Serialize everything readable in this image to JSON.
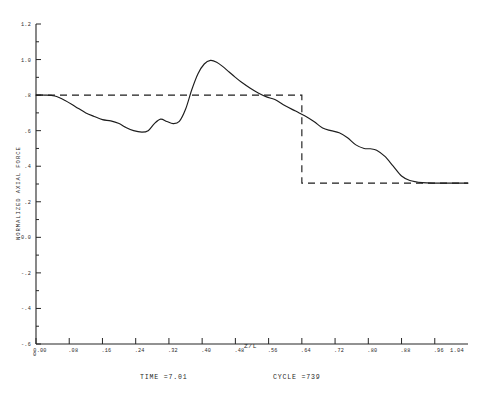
{
  "chart_data": {
    "type": "line",
    "title": "",
    "xlabel": "Z/L",
    "ylabel": "NORMALIZED AXIAL FORCE",
    "xlim": [
      0.0,
      1.04
    ],
    "ylim": [
      -0.6,
      1.2
    ],
    "grid": false,
    "legend": false,
    "x_tick_labels": [
      "0.00",
      ".08",
      ".16",
      ".24",
      ".32",
      ".40",
      ".48",
      ".56",
      ".64",
      ".72",
      ".80",
      ".88",
      ".96"
    ],
    "x_tick_values": [
      0.0,
      0.08,
      0.16,
      0.24,
      0.32,
      0.4,
      0.48,
      0.56,
      0.64,
      0.72,
      0.8,
      0.88,
      0.96
    ],
    "x_axis_end_label": "1.04",
    "x_origin_label": "0",
    "y_tick_labels": [
      "1.2",
      "1.0",
      ".8",
      ".6",
      ".4",
      ".2",
      "0.0",
      "-.2",
      "-.4",
      "-.6"
    ],
    "y_tick_values": [
      1.2,
      1.0,
      0.8,
      0.6,
      0.4,
      0.2,
      0.0,
      -0.2,
      -0.4,
      -0.6
    ],
    "y_labeled_ticks": [
      "1.2",
      "1.0",
      ".8",
      ".6",
      ".4",
      ".2",
      "0.0",
      "-.2",
      "-.4",
      "-.6"
    ],
    "series": [
      {
        "name": "computed axial force",
        "style": "solid",
        "x": [
          0.0,
          0.02,
          0.045,
          0.07,
          0.095,
          0.12,
          0.14,
          0.16,
          0.18,
          0.2,
          0.215,
          0.235,
          0.255,
          0.27,
          0.285,
          0.3,
          0.315,
          0.33,
          0.345,
          0.36,
          0.375,
          0.39,
          0.405,
          0.42,
          0.435,
          0.45,
          0.465,
          0.48,
          0.495,
          0.515,
          0.535,
          0.555,
          0.575,
          0.6,
          0.625,
          0.65,
          0.67,
          0.69,
          0.71,
          0.73,
          0.75,
          0.77,
          0.79,
          0.805,
          0.82,
          0.84,
          0.86,
          0.88,
          0.9,
          0.93,
          0.96,
          1.0,
          1.04
        ],
        "y": [
          0.8,
          0.8,
          0.795,
          0.77,
          0.735,
          0.7,
          0.68,
          0.662,
          0.655,
          0.64,
          0.62,
          0.6,
          0.592,
          0.6,
          0.64,
          0.665,
          0.652,
          0.64,
          0.652,
          0.72,
          0.83,
          0.92,
          0.975,
          0.995,
          0.985,
          0.96,
          0.93,
          0.9,
          0.872,
          0.84,
          0.812,
          0.79,
          0.775,
          0.74,
          0.71,
          0.68,
          0.65,
          0.615,
          0.6,
          0.588,
          0.56,
          0.52,
          0.5,
          0.498,
          0.49,
          0.455,
          0.4,
          0.345,
          0.32,
          0.308,
          0.305,
          0.305,
          0.305
        ]
      },
      {
        "name": "reference step",
        "style": "dashed",
        "x": [
          0.0,
          0.64,
          0.64,
          1.04
        ],
        "y": [
          0.8,
          0.8,
          0.305,
          0.305
        ]
      }
    ],
    "annotations": [
      {
        "name": "time-annotation",
        "text": "TIME =7.01"
      },
      {
        "name": "cycle-annotation",
        "text": "CYCLE =739"
      }
    ]
  },
  "footer": {
    "time_label": "TIME =7.01",
    "cycle_label": "CYCLE =739"
  },
  "axes": {
    "x_title": "Z/L",
    "y_title": "NORMALIZED AXIAL FORCE",
    "x_end": "1.04",
    "x_origin": "0"
  }
}
